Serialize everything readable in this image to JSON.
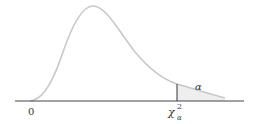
{
  "diagram": {
    "type": "chi-square distribution with right-tail area",
    "labels": {
      "origin": "0",
      "critical_value": "χ",
      "critical_sup": "2",
      "critical_sub": "α",
      "tail_area": "α"
    },
    "colors": {
      "curve": "#c8c8c8",
      "axis": "#444444",
      "critical_line": "#333333",
      "tail_fill": "#eeeeee"
    }
  }
}
